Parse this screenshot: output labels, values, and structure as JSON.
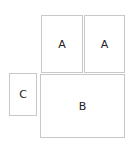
{
  "diagram": {
    "boxes": [
      {
        "id": "a-left",
        "label": "A"
      },
      {
        "id": "a-right",
        "label": "A"
      },
      {
        "id": "b",
        "label": "B"
      },
      {
        "id": "c",
        "label": "C"
      }
    ],
    "border_color": "#c8c8c8",
    "text_color": "#222222"
  }
}
